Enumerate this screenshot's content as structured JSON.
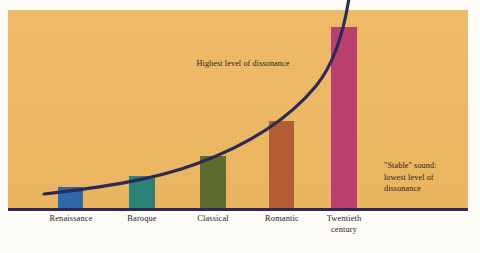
{
  "figure": {
    "background_color": "#fdfbf6",
    "panel_color": "#eeb862",
    "axis_color": "#2d2856",
    "curve_color": "#2d2856",
    "text_color": "#2b2118"
  },
  "annotations": {
    "high": "Highest level of dissonance",
    "stable": "\"Stable\" sound:\nlowest level of\ndissonance"
  },
  "chart_data": {
    "type": "bar",
    "title": "",
    "subtitle": "",
    "xlabel": "",
    "ylabel": "",
    "grid": false,
    "legend": "none",
    "ylim": [
      0,
      100
    ],
    "categories": [
      "Renaissance",
      "Baroque",
      "Classical",
      "Romantic",
      "Twentieth\ncentury"
    ],
    "values": [
      11,
      17,
      27,
      45,
      92
    ],
    "colors": [
      "#2f68a8",
      "#2d8278",
      "#5d6b2f",
      "#b45c33",
      "#b83f6e"
    ],
    "annotations": [
      {
        "text": "Highest level of dissonance",
        "x": 240,
        "y": 65
      },
      {
        "text": "\"Stable\" sound: lowest level of dissonance",
        "x": 385,
        "y": 180
      }
    ],
    "overlay_series": {
      "name": "Level of dissonance",
      "type": "line",
      "color": "#2d2856",
      "x": [
        "Renaissance",
        "Baroque",
        "Classical",
        "Romantic",
        "Twentieth century"
      ],
      "values": [
        11,
        17,
        27,
        45,
        92
      ]
    }
  },
  "bars": [
    {
      "name": "renaissance",
      "label": "Renaissance",
      "color": "#2f68a8",
      "left": 58,
      "width": 25,
      "top": 187,
      "label_left": 34,
      "label_width": 74
    },
    {
      "name": "baroque",
      "label": "Baroque",
      "color": "#2d8278",
      "left": 129,
      "width": 26,
      "top": 176,
      "label_left": 106,
      "label_width": 72
    },
    {
      "name": "classical",
      "label": "Classical",
      "color": "#5d6b2f",
      "left": 200,
      "width": 26,
      "top": 156,
      "label_left": 177,
      "label_width": 72
    },
    {
      "name": "romantic",
      "label": "Romantic",
      "color": "#b45c33",
      "left": 269,
      "width": 25,
      "top": 121,
      "label_left": 246,
      "label_width": 72
    },
    {
      "name": "twentieth",
      "label": "Twentieth\ncentury",
      "color": "#b83f6e",
      "left": 331,
      "width": 26,
      "top": 27,
      "label_left": 307,
      "label_width": 74
    }
  ]
}
